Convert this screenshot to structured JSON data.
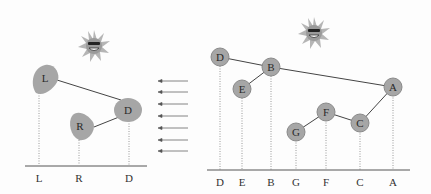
{
  "colors": {
    "node_fill": "#a6a6a6",
    "node_stroke": "#8a8a8a",
    "edge": "#444444",
    "dotted": "#9a9a9a",
    "axis": "#555555",
    "sun": "#b0b0b0"
  },
  "left_panel": {
    "nodes": [
      {
        "id": "L",
        "label": "L",
        "shape": "blob"
      },
      {
        "id": "R",
        "label": "R",
        "shape": "blob"
      },
      {
        "id": "D",
        "label": "D",
        "shape": "circle"
      }
    ],
    "edges": [
      [
        "L",
        "D"
      ],
      [
        "R",
        "D"
      ]
    ],
    "axis_labels": [
      "L",
      "R",
      "D"
    ]
  },
  "arrows": {
    "count": 7,
    "direction": "left"
  },
  "right_panel": {
    "nodes": [
      {
        "id": "D",
        "label": "D"
      },
      {
        "id": "B",
        "label": "B"
      },
      {
        "id": "E",
        "label": "E"
      },
      {
        "id": "A",
        "label": "A"
      },
      {
        "id": "F",
        "label": "F"
      },
      {
        "id": "G",
        "label": "G"
      },
      {
        "id": "C",
        "label": "C"
      }
    ],
    "edges": [
      [
        "D",
        "B"
      ],
      [
        "B",
        "E"
      ],
      [
        "B",
        "A"
      ],
      [
        "A",
        "C"
      ],
      [
        "C",
        "F"
      ],
      [
        "F",
        "G"
      ]
    ],
    "axis_labels": [
      "D",
      "E",
      "B",
      "G",
      "F",
      "C",
      "A"
    ]
  },
  "icons": [
    "sun-icon-left",
    "sun-icon-right"
  ]
}
